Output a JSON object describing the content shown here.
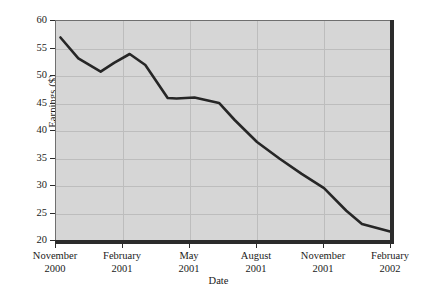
{
  "chart_data": {
    "type": "line",
    "title": "",
    "subtitle": "",
    "xlabel": "Date",
    "ylabel": "Earnings ($)",
    "ylim": [
      20,
      60
    ],
    "yticks": [
      20,
      25,
      30,
      35,
      40,
      45,
      50,
      55,
      60
    ],
    "ytick_labels": [
      "20",
      "25",
      "30",
      "35",
      "40",
      "45",
      "50",
      "55",
      "60"
    ],
    "xtick_labels": [
      {
        "month": "November",
        "year": "2000"
      },
      {
        "month": "February",
        "year": "2001"
      },
      {
        "month": "May",
        "year": "2001"
      },
      {
        "month": "August",
        "year": "2001"
      },
      {
        "month": "November",
        "year": "2001"
      },
      {
        "month": "February",
        "year": "2002"
      }
    ],
    "xtick_positions_months": [
      0,
      3,
      6,
      9,
      12,
      15
    ],
    "xlim_months": [
      0,
      15
    ],
    "grid": true,
    "legend": "none",
    "series": [
      {
        "name": "Earnings",
        "color": "#262626",
        "line_width": 2.6,
        "x": [
          0.2,
          1.0,
          2.0,
          2.6,
          3.3,
          4.0,
          5.0,
          5.4,
          6.2,
          7.3,
          8.0,
          9.0,
          10.0,
          11.0,
          12.0,
          13.0,
          13.7,
          15.0
        ],
        "values": [
          57.0,
          53.2,
          50.8,
          52.4,
          54.0,
          52.0,
          46.0,
          45.9,
          46.1,
          45.1,
          42.0,
          38.0,
          35.0,
          32.2,
          29.6,
          25.5,
          23.1,
          21.7
        ]
      }
    ],
    "plot_background": "#d6d6d6",
    "grid_color": "#bdbdbd",
    "axis_color": "#2b2b2b"
  }
}
